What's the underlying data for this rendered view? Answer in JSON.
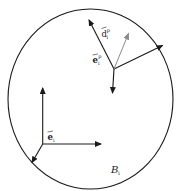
{
  "diagram": {
    "type": "body-frame-schematic",
    "colors": {
      "stroke": "#1a1a1a",
      "secondary_stroke": "#8a8a8a",
      "background": "#ffffff"
    },
    "body": {
      "label": "B",
      "label_sub": "i"
    },
    "frames": [
      {
        "name": "body-frame",
        "label": "e",
        "label_sub": "i",
        "label_sup": ""
      },
      {
        "name": "point-frame",
        "label": "e",
        "label_sub": "i",
        "label_sup": "p"
      }
    ],
    "vectors": [
      {
        "name": "d-vector",
        "label": "d",
        "label_sub": "i",
        "label_sup": "p"
      }
    ]
  }
}
